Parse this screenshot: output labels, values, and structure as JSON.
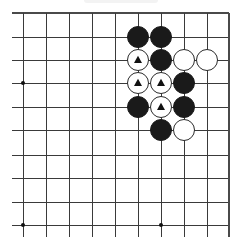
{
  "diagram": {
    "type": "go-board-problem",
    "board_region": "top-right corner (partial view)",
    "grid": {
      "columns_x": [
        23,
        46,
        69,
        92,
        115,
        138,
        161,
        184,
        207,
        229
      ],
      "rows_y": [
        13,
        37,
        60,
        83,
        107,
        130,
        155,
        178,
        202,
        225
      ],
      "left_extend_to_x": 12,
      "bottom_extend_to_y": 237,
      "top_edge": true,
      "right_edge": true,
      "line_color": "#3a3a3a"
    },
    "hoshi": [
      {
        "col": 0,
        "row": 3
      },
      {
        "col": 0,
        "row": 9
      },
      {
        "col": 6,
        "row": 9
      }
    ],
    "stone_radius": 10.5,
    "colors": {
      "black_stone": "#1a1a1a",
      "white_stone": "#ffffff",
      "white_stone_border": "#2a2a2a",
      "marker": "#111111"
    },
    "stones": [
      {
        "color": "black",
        "col": 5,
        "row": 1,
        "marker": null
      },
      {
        "color": "black",
        "col": 6,
        "row": 1,
        "marker": null
      },
      {
        "color": "white",
        "col": 5,
        "row": 2,
        "marker": "triangle"
      },
      {
        "color": "black",
        "col": 6,
        "row": 2,
        "marker": null
      },
      {
        "color": "white",
        "col": 7,
        "row": 2,
        "marker": null
      },
      {
        "color": "white",
        "col": 8,
        "row": 2,
        "marker": null
      },
      {
        "color": "white",
        "col": 5,
        "row": 3,
        "marker": "triangle"
      },
      {
        "color": "white",
        "col": 6,
        "row": 3,
        "marker": "triangle"
      },
      {
        "color": "black",
        "col": 7,
        "row": 3,
        "marker": null
      },
      {
        "color": "black",
        "col": 5,
        "row": 4,
        "marker": null
      },
      {
        "color": "white",
        "col": 6,
        "row": 4,
        "marker": "triangle"
      },
      {
        "color": "black",
        "col": 7,
        "row": 4,
        "marker": null
      },
      {
        "color": "black",
        "col": 6,
        "row": 5,
        "marker": null
      },
      {
        "color": "white",
        "col": 7,
        "row": 5,
        "marker": null
      }
    ],
    "summary": {
      "black_count": 7,
      "white_count": 7,
      "marked_white_stones": 4,
      "marker_symbol": "triangle"
    }
  }
}
